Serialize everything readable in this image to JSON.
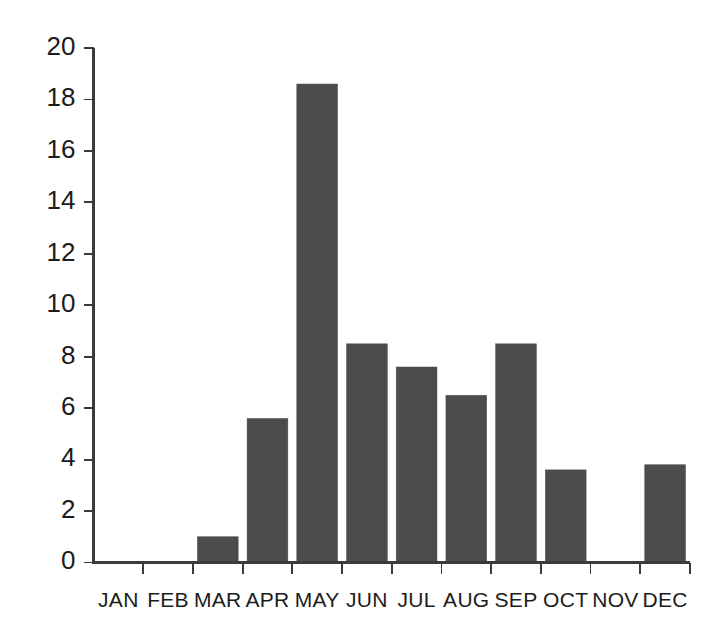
{
  "chart_data": {
    "type": "bar",
    "title": "",
    "subtitle": "",
    "xlabel": "",
    "ylabel": "",
    "categories": [
      "JAN",
      "FEB",
      "MAR",
      "APR",
      "MAY",
      "JUN",
      "JUL",
      "AUG",
      "SEP",
      "OCT",
      "NOV",
      "DEC"
    ],
    "values": [
      0,
      0,
      1.0,
      5.6,
      18.6,
      8.5,
      7.6,
      6.5,
      8.5,
      3.6,
      0,
      3.8
    ],
    "ylim": [
      0,
      20
    ],
    "yticks": [
      0,
      2,
      4,
      6,
      8,
      10,
      12,
      14,
      16,
      18,
      20
    ],
    "ytick_labels": [
      "0",
      "2",
      "4",
      "6",
      "8",
      "10",
      "12",
      "14",
      "16",
      "18",
      "20"
    ],
    "grid": false,
    "legend": false,
    "legend_position": "none",
    "bar_color": "#4c4c4c",
    "axis_color": "#3b3b3b",
    "background_color": "#ffffff"
  }
}
